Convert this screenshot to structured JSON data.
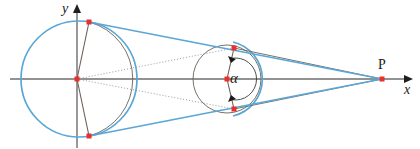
{
  "figure": {
    "type": "geometry-diagram",
    "width": 420,
    "height": 149,
    "background": "#ffffff"
  },
  "colors": {
    "axis": "#6e6e6e",
    "blue": "#5aa7d6",
    "gray_line": "#6b6159",
    "dotted": "#9b9b9b",
    "point": "#e8312a",
    "text": "#1a1a1a"
  },
  "labels": {
    "y_axis": "y",
    "x_axis": "x",
    "external_point": "P",
    "angle": "α"
  },
  "axes": {
    "x": {
      "y": 79,
      "x_start": 10,
      "x_end": 412,
      "arrow": true
    },
    "y": {
      "x": 77,
      "y_start": 8,
      "y_end": 148,
      "arrow": true
    }
  },
  "circles": [
    {
      "name": "large-blue-circle",
      "cx": 79,
      "cy": 79,
      "r": 58,
      "stroke": "#5aa7d6",
      "stroke_width": 1.6,
      "dashed": false
    },
    {
      "name": "left-gray-arc",
      "cx": 79,
      "cy": 79,
      "r": 59,
      "stroke": "#6b6159",
      "stroke_width": 0.9,
      "note": "right-bulging arc through top and bottom tangency points"
    },
    {
      "name": "small-gray-circle",
      "cx": 227,
      "cy": 79,
      "r": 34,
      "stroke": "#6b6159",
      "stroke_width": 0.9,
      "dashed": false
    },
    {
      "name": "small-blue-arc",
      "cx": 227,
      "cy": 79,
      "r": 38,
      "stroke": "#5aa7d6",
      "stroke_width": 1.6,
      "note": "blue arc hugging right side of small circle"
    },
    {
      "name": "angle-arc",
      "cx": 227,
      "cy": 79,
      "r": 21,
      "stroke": "#3a3a3a",
      "stroke_width": 0.9
    }
  ],
  "points": [
    {
      "name": "origin",
      "x": 77,
      "y": 79,
      "label": ""
    },
    {
      "name": "upper-tangency-large",
      "x": 89,
      "y": 22,
      "label": ""
    },
    {
      "name": "lower-tangency-large",
      "x": 89,
      "y": 136,
      "label": ""
    },
    {
      "name": "small-circle-center",
      "x": 227,
      "y": 79,
      "label": ""
    },
    {
      "name": "upper-tangency-small",
      "x": 234,
      "y": 48,
      "label": ""
    },
    {
      "name": "lower-tangency-small",
      "x": 234,
      "y": 109,
      "label": ""
    },
    {
      "name": "external-point-P",
      "x": 382,
      "y": 79,
      "label": "P"
    }
  ],
  "segments": [
    {
      "name": "blue-upper-tangent",
      "x1": 89,
      "y1": 22,
      "x2": 382,
      "y2": 79,
      "stroke": "#5aa7d6",
      "width": 1.6,
      "style": "solid"
    },
    {
      "name": "blue-lower-tangent",
      "x1": 89,
      "y1": 136,
      "x2": 382,
      "y2": 79,
      "stroke": "#5aa7d6",
      "width": 1.6,
      "style": "solid"
    },
    {
      "name": "chord-upper",
      "x1": 77,
      "y1": 79,
      "x2": 89,
      "y2": 22,
      "stroke": "#6b6159",
      "width": 1.0,
      "style": "solid"
    },
    {
      "name": "chord-lower",
      "x1": 77,
      "y1": 79,
      "x2": 89,
      "y2": 136,
      "stroke": "#6b6159",
      "width": 1.0,
      "style": "solid"
    },
    {
      "name": "gray-upper-tangent",
      "x1": 234,
      "y1": 48,
      "x2": 382,
      "y2": 79,
      "stroke": "#6b6159",
      "width": 0.9,
      "style": "solid"
    },
    {
      "name": "gray-lower-tangent",
      "x1": 234,
      "y1": 109,
      "x2": 382,
      "y2": 79,
      "stroke": "#6b6159",
      "width": 0.9,
      "style": "solid"
    },
    {
      "name": "small-chord-upper",
      "x1": 227,
      "y1": 79,
      "x2": 234,
      "y2": 48,
      "stroke": "#6b6159",
      "width": 1.0,
      "style": "solid"
    },
    {
      "name": "small-chord-lower",
      "x1": 227,
      "y1": 79,
      "x2": 234,
      "y2": 109,
      "stroke": "#6b6159",
      "width": 1.0,
      "style": "solid"
    },
    {
      "name": "dotted-ray-upper",
      "x1": 77,
      "y1": 79,
      "x2": 234,
      "y2": 48,
      "stroke": "#9b9b9b",
      "width": 0.9,
      "style": "dotted"
    },
    {
      "name": "dotted-ray-lower",
      "x1": 77,
      "y1": 79,
      "x2": 234,
      "y2": 109,
      "stroke": "#9b9b9b",
      "width": 0.9,
      "style": "dotted"
    },
    {
      "name": "center-axis-segment",
      "x1": 227,
      "y1": 79,
      "x2": 382,
      "y2": 79,
      "stroke": "#6e6e6e",
      "width": 1.0,
      "style": "solid"
    }
  ]
}
